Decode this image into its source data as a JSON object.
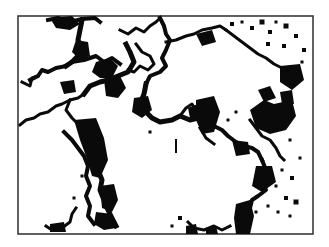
{
  "figure": {
    "background": "#ffffff",
    "ink": "#0a0a0a",
    "frame": {
      "x": 18,
      "y": 16,
      "width": 295,
      "height": 218,
      "color": "#3a3a3a"
    },
    "branches": [
      {
        "w": 4,
        "points": "48,20 58,18 70,22 82,19 95,18 100,22"
      },
      {
        "w": 5,
        "points": "82,20 80,30 78,40 82,48 78,56 72,62 66,66"
      },
      {
        "w": 4,
        "points": "66,66 56,68 48,72 42,70 38,76 30,80"
      },
      {
        "w": 3,
        "points": "38,76 32,78 30,86 22,82"
      },
      {
        "w": 4,
        "points": "72,62 84,60 96,56 104,62 112,58 120,64"
      },
      {
        "w": 3,
        "points": "20,125 26,120 34,118 40,114 48,112 56,106 62,104 70,100 78,98 84,94"
      },
      {
        "w": 5,
        "points": "84,94 90,86 100,82 108,80 118,76 128,72 134,62 130,52 126,44"
      },
      {
        "w": 3,
        "points": "120,30 128,34 136,28 144,32 150,26 156,22 160,18"
      },
      {
        "w": 4,
        "points": "160,18 164,26 166,34 170,40 166,50 162,58 166,66 160,72 150,76 146,84"
      },
      {
        "w": 3,
        "points": "136,44 142,52 150,56 154,64 148,70 140,66 134,72 128,70"
      },
      {
        "w": 5,
        "points": "146,84 144,94 140,104 146,112 152,118 160,122 172,120 180,116 190,120 198,118 206,122"
      },
      {
        "w": 3,
        "points": "166,42 176,40 186,36 194,34 202,30 212,28 220,26 226,30"
      },
      {
        "w": 3,
        "points": "226,30 234,36 242,42 250,48 258,54 266,58 274,64 282,68 290,72 296,76"
      },
      {
        "w": 3,
        "points": "180,116 186,108 192,104 196,110"
      },
      {
        "w": 4,
        "points": "206,122 214,126 222,130 228,136 236,142 244,146 252,148 258,152 262,160"
      },
      {
        "w": 3,
        "points": "70,100 66,110 72,118 78,124 86,130"
      },
      {
        "w": 5,
        "points": "86,130 92,140 96,150 100,160 98,170 102,180 100,190 104,200 108,210 112,218 116,226"
      },
      {
        "w": 4,
        "points": "64,132 72,140 78,148 84,156 88,166 86,176 90,186 86,196 90,206 88,216 94,224"
      },
      {
        "w": 3,
        "points": "76,208 72,214 70,222 62,228 52,230 46,226"
      },
      {
        "w": 3,
        "points": "250,120 256,128 262,136 270,140 276,148 280,156 284,160"
      },
      {
        "w": 4,
        "points": "262,160 266,170 262,180 266,190 258,196 252,200 250,208"
      },
      {
        "w": 3,
        "points": "188,222 194,228 204,230 214,226 222,230 230,226"
      },
      {
        "w": 2,
        "points": "176,140 176,152"
      },
      {
        "w": 3,
        "points": "200,128 206,138 214,144"
      }
    ],
    "blobs": [
      {
        "points": "50,18 72,16 80,24 70,30 56,28"
      },
      {
        "points": "76,40 88,42 90,56 80,60 72,52"
      },
      {
        "points": "96,62 110,58 118,66 112,78 100,78 92,72"
      },
      {
        "points": "104,80 120,76 126,88 118,98 106,96"
      },
      {
        "points": "134,98 148,96 152,110 142,118 132,112"
      },
      {
        "points": "60,82 74,80 76,92 64,94"
      },
      {
        "points": "74,120 96,118 104,138 108,160 100,178 92,176 86,156 80,140"
      },
      {
        "points": "100,186 114,184 118,200 112,212 102,208"
      },
      {
        "points": "96,212 112,214 116,228 104,230 94,224"
      },
      {
        "points": "50,224 64,222 66,232 50,232"
      },
      {
        "points": "196,34 212,30 216,42 202,46"
      },
      {
        "points": "196,100 214,96 220,112 214,132 202,134 196,120"
      },
      {
        "points": "188,108 198,104 200,116 190,118"
      },
      {
        "points": "280,66 300,64 304,80 292,90 280,82"
      },
      {
        "points": "250,110 264,100 274,104 292,100 296,116 286,130 270,134 256,128"
      },
      {
        "points": "258,90 270,86 276,98 264,102"
      },
      {
        "points": "232,140 248,142 250,154 236,156"
      },
      {
        "points": "256,166 272,166 276,182 262,192 252,186"
      },
      {
        "points": "236,204 250,200 254,216 250,234 236,234 234,218"
      },
      {
        "points": "186,226 196,224 198,234 186,234"
      },
      {
        "points": "206,228 216,226 218,234 206,234"
      },
      {
        "points": "280,92 292,90 294,104 282,104"
      }
    ],
    "dots": [
      {
        "x": 232,
        "y": 24,
        "r": 2
      },
      {
        "x": 242,
        "y": 22,
        "r": 1.5
      },
      {
        "x": 252,
        "y": 28,
        "r": 2
      },
      {
        "x": 262,
        "y": 22,
        "r": 2.5
      },
      {
        "x": 270,
        "y": 32,
        "r": 2
      },
      {
        "x": 276,
        "y": 22,
        "r": 1.5
      },
      {
        "x": 286,
        "y": 26,
        "r": 2.5
      },
      {
        "x": 296,
        "y": 36,
        "r": 2
      },
      {
        "x": 304,
        "y": 50,
        "r": 2
      },
      {
        "x": 284,
        "y": 46,
        "r": 2
      },
      {
        "x": 268,
        "y": 44,
        "r": 2
      },
      {
        "x": 302,
        "y": 62,
        "r": 1.5
      },
      {
        "x": 290,
        "y": 140,
        "r": 1.5
      },
      {
        "x": 300,
        "y": 158,
        "r": 1.5
      },
      {
        "x": 282,
        "y": 170,
        "r": 1.5
      },
      {
        "x": 292,
        "y": 178,
        "r": 2
      },
      {
        "x": 276,
        "y": 186,
        "r": 1.5
      },
      {
        "x": 286,
        "y": 198,
        "r": 2
      },
      {
        "x": 296,
        "y": 202,
        "r": 2.5
      },
      {
        "x": 268,
        "y": 206,
        "r": 1.5
      },
      {
        "x": 278,
        "y": 212,
        "r": 1.5
      },
      {
        "x": 290,
        "y": 216,
        "r": 1.5
      },
      {
        "x": 256,
        "y": 212,
        "r": 1.5
      },
      {
        "x": 180,
        "y": 218,
        "r": 2
      },
      {
        "x": 172,
        "y": 226,
        "r": 1.5
      },
      {
        "x": 236,
        "y": 112,
        "r": 1.5
      },
      {
        "x": 228,
        "y": 120,
        "r": 1.5
      },
      {
        "x": 82,
        "y": 176,
        "r": 1.5
      },
      {
        "x": 74,
        "y": 198,
        "r": 1.5
      },
      {
        "x": 150,
        "y": 132,
        "r": 1.5
      }
    ]
  }
}
